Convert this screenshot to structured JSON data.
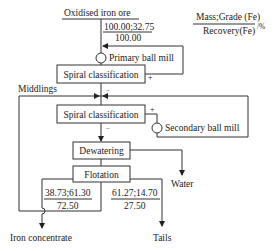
{
  "diagram": {
    "type": "process-flowsheet",
    "feed": {
      "label": "Oxidised iron ore",
      "mass_grade": "100.00;32.75",
      "recovery": "100.00"
    },
    "legend": {
      "numerator": "Mass;Grade (Fe)",
      "denominator": "Recovery(Fe)",
      "unit": "/%"
    },
    "nodes": {
      "primary_mill": "Primary ball mill",
      "spiral_1": "Spiral classification",
      "spiral_2": "Spiral classification",
      "secondary_mill": "Secondary ball mill",
      "dewatering": "Dewatering",
      "flotation": "Flotation"
    },
    "signs": {
      "spiral1_plus": "+",
      "spiral1_minus": "−",
      "spiral2_plus": "+",
      "spiral2_minus": "−"
    },
    "labels": {
      "middlings": "Middlings",
      "water": "Water"
    },
    "products": {
      "concentrate": {
        "label": "Iron concentrate",
        "mass_grade": "38.73;61.30",
        "recovery": "72.50"
      },
      "tails": {
        "label": "Tails",
        "mass_grade": "61.27;14.70",
        "recovery": "27.50"
      }
    }
  }
}
